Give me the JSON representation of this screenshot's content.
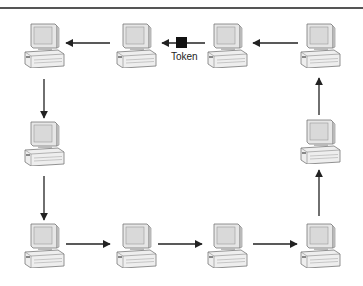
{
  "diagram": {
    "title_fragment": "",
    "type": "token-ring-network",
    "node_icon": "desktop-computer-icon",
    "token": {
      "label": "Token",
      "color": "#111111"
    },
    "nodes": [
      {
        "id": "top-1",
        "x": 22,
        "y": 22
      },
      {
        "id": "top-2",
        "x": 114,
        "y": 22
      },
      {
        "id": "top-3",
        "x": 205,
        "y": 22
      },
      {
        "id": "top-4",
        "x": 298,
        "y": 22
      },
      {
        "id": "mid-left",
        "x": 22,
        "y": 120
      },
      {
        "id": "mid-right",
        "x": 298,
        "y": 118
      },
      {
        "id": "bot-1",
        "x": 22,
        "y": 222
      },
      {
        "id": "bot-2",
        "x": 114,
        "y": 222
      },
      {
        "id": "bot-3",
        "x": 205,
        "y": 222
      },
      {
        "id": "bot-4",
        "x": 298,
        "y": 222
      }
    ],
    "flow": "counter-clockwise ring: top row right-to-left, left column downward, bottom row left-to-right, right column upward"
  }
}
